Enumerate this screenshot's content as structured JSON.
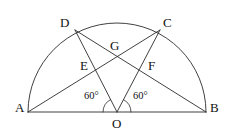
{
  "figure": {
    "type": "geometry-diagram",
    "stroke_color": "#2b2b2b",
    "background_color": "#ffffff",
    "points": {
      "A": {
        "label": "A",
        "x": 28,
        "y": 112
      },
      "B": {
        "label": "B",
        "x": 206,
        "y": 112
      },
      "O": {
        "label": "O",
        "x": 117,
        "y": 112
      },
      "C": {
        "label": "C",
        "x": 160,
        "y": 30
      },
      "D": {
        "label": "D",
        "x": 75,
        "y": 30
      },
      "E": {
        "label": "E",
        "x": 95,
        "y": 72
      },
      "F": {
        "label": "F",
        "x": 142,
        "y": 72
      },
      "G": {
        "label": "G",
        "x": 117,
        "y": 56
      }
    },
    "angles": {
      "left": {
        "label": "60°",
        "vertex": "O",
        "between": "AO and OD"
      },
      "right": {
        "label": "60°",
        "vertex": "O",
        "between": "BO and OC"
      }
    },
    "semicircle": {
      "center_x": 117,
      "center_y": 112,
      "radius": 89,
      "start": "A",
      "end": "B"
    },
    "segments": [
      {
        "name": "diameter-AB",
        "from": "A",
        "to": "B"
      },
      {
        "name": "radius-OD",
        "from": "O",
        "to": "D"
      },
      {
        "name": "radius-OC",
        "from": "O",
        "to": "C"
      },
      {
        "name": "chord-AC",
        "from": "A",
        "to": "C"
      },
      {
        "name": "chord-BD",
        "from": "B",
        "to": "D"
      }
    ]
  }
}
